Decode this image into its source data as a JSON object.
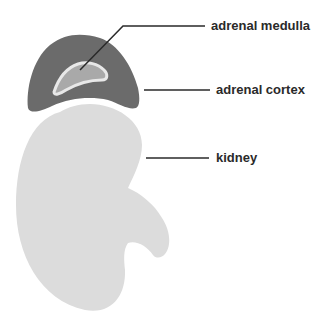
{
  "diagram": {
    "title": "",
    "colors": {
      "background": "#ffffff",
      "adrenal_cortex": "#6b6b6b",
      "adrenal_medulla": "#a9a9a9",
      "medulla_outline": "#e8e8e8",
      "kidney": "#dcdcdc",
      "leader_line": "#2a2a2a",
      "label_text": "#2a2a2a"
    },
    "labels": [
      {
        "id": "adrenal-medulla",
        "text": "adrenal medulla"
      },
      {
        "id": "adrenal-cortex",
        "text": "adrenal cortex"
      },
      {
        "id": "kidney",
        "text": "kidney"
      }
    ]
  }
}
